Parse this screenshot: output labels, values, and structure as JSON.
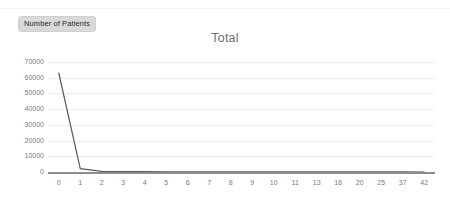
{
  "legend": {
    "label": "Number of Patients"
  },
  "chart_data": {
    "type": "line",
    "title": "Total",
    "xlabel": "",
    "ylabel": "",
    "categories": [
      "0",
      "1",
      "2",
      "3",
      "4",
      "5",
      "6",
      "7",
      "8",
      "9",
      "10",
      "11",
      "13",
      "16",
      "20",
      "25",
      "37",
      "42"
    ],
    "values": [
      63000,
      2100,
      400,
      250,
      180,
      150,
      120,
      100,
      90,
      80,
      70,
      60,
      50,
      40,
      30,
      25,
      20,
      15
    ],
    "series": [
      {
        "name": "Number of Patients",
        "values": [
          63000,
          2100,
          400,
          250,
          180,
          150,
          120,
          100,
          90,
          80,
          70,
          60,
          50,
          40,
          30,
          25,
          20,
          15
        ]
      }
    ],
    "ylim": [
      0,
      70000
    ],
    "yticks": [
      70000,
      60000,
      50000,
      40000,
      30000,
      20000,
      10000,
      0
    ],
    "ytick_labels": [
      "70000",
      "60000",
      "50000",
      "40000",
      "30000",
      "20000",
      "10000",
      "0"
    ],
    "grid": true,
    "legend_position": "top-left",
    "line_color": "#595959",
    "grid_color": "#ededed",
    "axis_color": "#8d8d8d",
    "title_color": "#6f6f6f",
    "tick_color": "#7a7a7a"
  }
}
